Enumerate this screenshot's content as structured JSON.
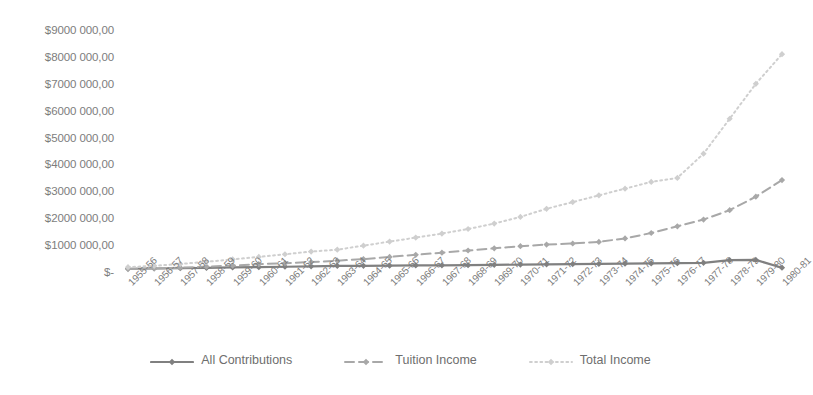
{
  "chart_data": {
    "type": "line",
    "title": "",
    "xlabel": "",
    "ylabel": "",
    "ylim": [
      0,
      9000000
    ],
    "grid": false,
    "legend_position": "bottom",
    "y_ticks": [
      {
        "value": 9000000,
        "label": "$9000 000,00"
      },
      {
        "value": 8000000,
        "label": "$8000 000,00"
      },
      {
        "value": 7000000,
        "label": "$7000 000,00"
      },
      {
        "value": 6000000,
        "label": "$6000 000,00"
      },
      {
        "value": 5000000,
        "label": "$5000 000,00"
      },
      {
        "value": 4000000,
        "label": "$4000 000,00"
      },
      {
        "value": 3000000,
        "label": "$3000 000,00"
      },
      {
        "value": 2000000,
        "label": "$2000 000,00"
      },
      {
        "value": 1000000,
        "label": "$1000 000,00"
      },
      {
        "value": 0,
        "label": "$-"
      }
    ],
    "categories": [
      "1955-56",
      "1956-57",
      "1957-58",
      "1958-59",
      "1959-60",
      "1960-61",
      "1961-62",
      "1962-63",
      "1963-64",
      "1964-65",
      "1965-66",
      "1966-67",
      "1967-68",
      "1968-69",
      "1969-70",
      "1970-71",
      "1971-72",
      "1972-73",
      "1973-74",
      "1974-75",
      "1975-76",
      "1976-77",
      "1977-78",
      "1978-79",
      "1979-80",
      "1980-81"
    ],
    "series": [
      {
        "name": "All Contributions",
        "color": "#808080",
        "line_style": "solid",
        "marker": "diamond",
        "values": [
          120000,
          130000,
          140000,
          150000,
          170000,
          180000,
          195000,
          210000,
          225000,
          230000,
          235000,
          245000,
          250000,
          255000,
          265000,
          275000,
          285000,
          295000,
          300000,
          310000,
          320000,
          330000,
          340000,
          440000,
          450000,
          160000
        ]
      },
      {
        "name": "Tuition Income",
        "color": "#a8a8a8",
        "line_style": "dashed",
        "marker": "diamond",
        "values": [
          110000,
          130000,
          160000,
          200000,
          240000,
          290000,
          330000,
          370000,
          420000,
          480000,
          560000,
          640000,
          720000,
          800000,
          880000,
          960000,
          1020000,
          1060000,
          1120000,
          1250000,
          1450000,
          1700000,
          1950000,
          2300000,
          2800000,
          3420000
        ]
      },
      {
        "name": "Total Income",
        "color": "#cfcfcf",
        "line_style": "dotted",
        "marker": "diamond",
        "values": [
          180000,
          230000,
          300000,
          380000,
          470000,
          560000,
          660000,
          760000,
          830000,
          980000,
          1130000,
          1280000,
          1430000,
          1600000,
          1800000,
          2050000,
          2350000,
          2600000,
          2850000,
          3100000,
          3350000,
          3500000,
          4400000,
          5700000,
          7000000,
          8100000
        ]
      }
    ]
  },
  "legend": {
    "items": [
      {
        "label": "All Contributions"
      },
      {
        "label": "Tuition Income"
      },
      {
        "label": "Total Income"
      }
    ]
  }
}
